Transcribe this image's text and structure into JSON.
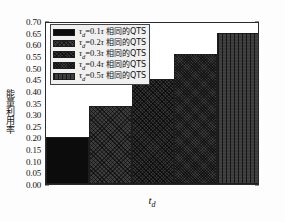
{
  "chart_data": {
    "type": "bar",
    "title": "",
    "xlabel": "t_d",
    "ylabel": "能量利用率",
    "categories": [
      "0.1τ",
      "0.2τ",
      "0.3τ",
      "0.4τ",
      "0.5τ"
    ],
    "values": [
      0.2,
      0.335,
      0.45,
      0.56,
      0.65
    ],
    "ylim": [
      0.0,
      0.7
    ],
    "ytick_labels": [
      "0.70",
      "0.65",
      "0.60",
      "0.55",
      "0.50",
      "0.45",
      "0.40",
      "0.35",
      "0.30",
      "0.25",
      "0.20",
      "0.15",
      "0.10",
      "0.05",
      "0.00"
    ],
    "ytick_values": [
      0.7,
      0.65,
      0.6,
      0.55,
      0.5,
      0.45,
      0.4,
      0.35,
      0.3,
      0.25,
      0.2,
      0.15,
      0.1,
      0.05,
      0.0
    ],
    "xtick_labels": [],
    "grid": false,
    "legend_position": "upper left",
    "series": [
      {
        "name": "τd=0.1τ 相同的QTS",
        "tau_sub": "d",
        "coef": "0.1",
        "cjk": "相同的QTS",
        "value": 0.2,
        "color": "#0c0c0c",
        "pattern": "solid"
      },
      {
        "name": "τd=0.2τ 相同的QTS",
        "tau_sub": "d",
        "coef": "0.2",
        "cjk": "相同的QTS",
        "value": 0.335,
        "color": "#3d3d3d",
        "pattern": "crosshatch-coarse"
      },
      {
        "name": "τd=0.3τ 相同的QTS",
        "tau_sub": "d",
        "coef": "0.3",
        "cjk": "相同的QTS",
        "value": 0.45,
        "color": "#343434",
        "pattern": "crosshatch-medium"
      },
      {
        "name": "τd=0.4τ 相同的QTS",
        "tau_sub": "d",
        "coef": "0.4",
        "cjk": "相同的QTS",
        "value": 0.56,
        "color": "#3a3a3a",
        "pattern": "crosshatch-fine"
      },
      {
        "name": "τd=0.5τ 相同的QTS",
        "tau_sub": "d",
        "coef": "0.5",
        "cjk": "相同的QTS",
        "value": 0.65,
        "color": "#3c3c3c",
        "pattern": "vertical-lines"
      }
    ]
  },
  "axes": {
    "y_title": "能量利用率",
    "x_title_base": "t",
    "x_title_sub": "d"
  },
  "colors": {
    "frame": "#2b2b2b",
    "legend_bg": "#f0f0f0",
    "text": "#111111",
    "figure_bg": "#fdfdfd"
  }
}
